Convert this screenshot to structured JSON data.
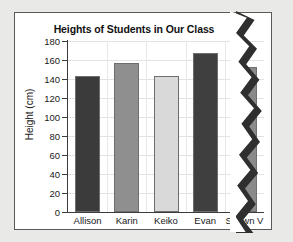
{
  "chart_data": {
    "type": "bar",
    "title": "Heights of Students in Our Class",
    "xlabel": "",
    "ylabel": "Height (cm)",
    "categories": [
      "Allison",
      "Karin",
      "Keiko",
      "Evan",
      "Shawn V"
    ],
    "values": [
      143,
      157,
      143,
      167,
      153
    ],
    "ylim": [
      0,
      180
    ],
    "ytick_labels": [
      "180",
      "160",
      "140",
      "120",
      "100",
      "80",
      "60",
      "40",
      "20",
      "0"
    ],
    "ytick_values": [
      180,
      160,
      140,
      120,
      100,
      80,
      60,
      40,
      20,
      0
    ],
    "ytick_step": 20,
    "grid": true,
    "legend": false,
    "bar_colors": [
      "#3b3b3b",
      "#8f8f8f",
      "#d9d9d9",
      "#3f3f3f",
      "#8a8a8a"
    ]
  },
  "page": {
    "background_color": "#e9e9e7",
    "card_background": "#ffffff",
    "border_color": "#5a5a5a",
    "torn_edge": "right"
  }
}
